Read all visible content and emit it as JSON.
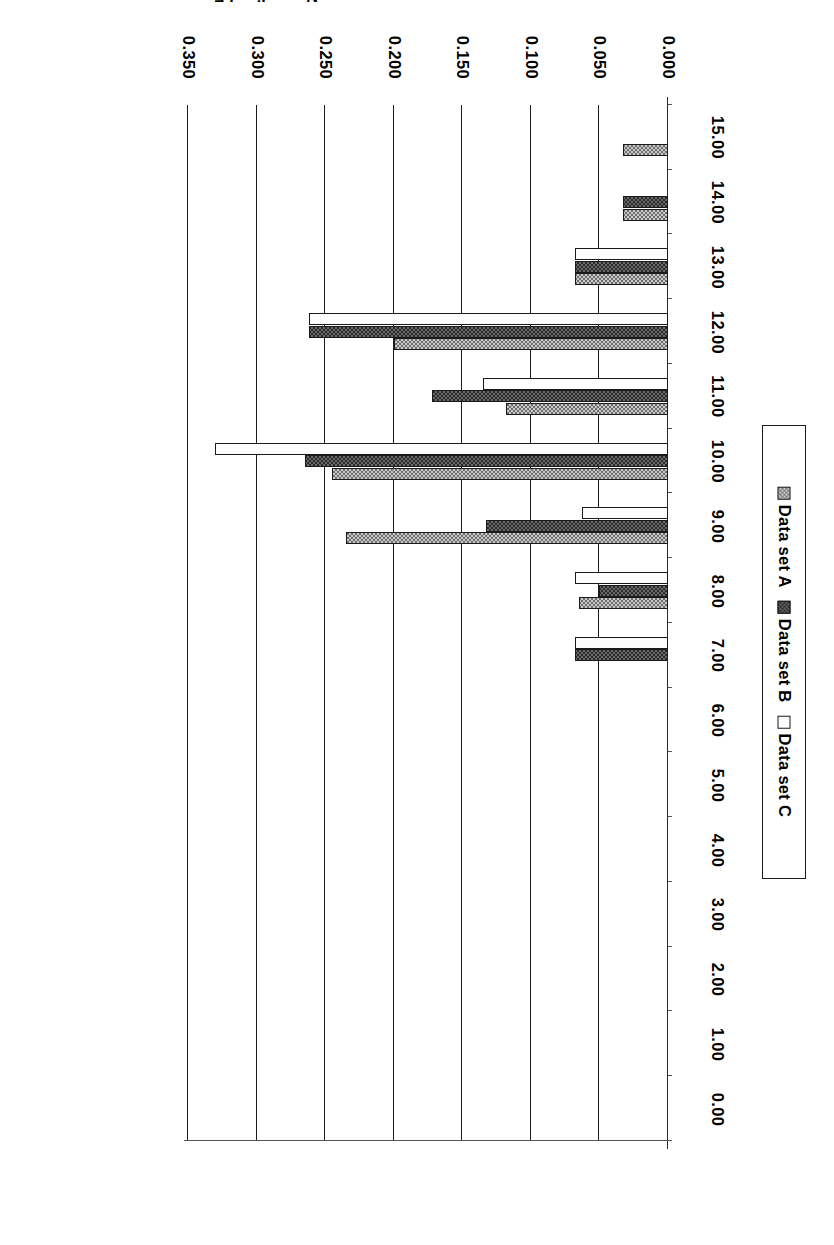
{
  "chart_data": {
    "type": "bar",
    "orientation": "horizontal",
    "title": "",
    "xlabel": "Number of Building Occupants",
    "ylabel": "Normalized Frequency",
    "categories": [
      "0.00",
      "1.00",
      "2.00",
      "3.00",
      "4.00",
      "5.00",
      "6.00",
      "7.00",
      "8.00",
      "9.00",
      "10.00",
      "11.00",
      "12.00",
      "13.00",
      "14.00",
      "15.00"
    ],
    "value_ticks": [
      "0.000",
      "0.050",
      "0.100",
      "0.150",
      "0.200",
      "0.250",
      "0.300",
      "0.350"
    ],
    "value_tick_numbers": [
      0.0,
      0.05,
      0.1,
      0.15,
      0.2,
      0.25,
      0.3,
      0.35
    ],
    "ylim": [
      0.0,
      0.35
    ],
    "grid": true,
    "legend_position": "left",
    "series": [
      {
        "name": "Data set A",
        "fill": "light-checker",
        "values": [
          0.0,
          0.0,
          0.0,
          0.0,
          0.0,
          0.0,
          0.0,
          0.0,
          0.065,
          0.235,
          0.245,
          0.118,
          0.2,
          0.068,
          0.033,
          0.033
        ]
      },
      {
        "name": "Data set B",
        "fill": "dark-checker",
        "values": [
          0.0,
          0.0,
          0.0,
          0.0,
          0.0,
          0.0,
          0.0,
          0.068,
          0.05,
          0.133,
          0.265,
          0.172,
          0.262,
          0.068,
          0.033,
          0.0
        ]
      },
      {
        "name": "Data set C",
        "fill": "white-stipple",
        "values": [
          0.0,
          0.0,
          0.0,
          0.0,
          0.0,
          0.0,
          0.0,
          0.068,
          0.068,
          0.063,
          0.33,
          0.135,
          0.262,
          0.068,
          0.0,
          0.0
        ]
      }
    ]
  },
  "legend": {
    "items": [
      {
        "label": "Data set A",
        "swatch": "light-checker"
      },
      {
        "label": "Data set B",
        "swatch": "dark-checker"
      },
      {
        "label": "Data set C",
        "swatch": "white-stipple"
      }
    ]
  },
  "axes": {
    "value_axis_title": "Normalized Frequency",
    "category_axis_title": "Number of Building Occupants"
  },
  "colors": {
    "axis": "#1b1b1b",
    "grid": "#1b1b1b",
    "series_a": "#c9c9c9",
    "series_b": "#2b2b2b",
    "series_c": "#fdfdfd",
    "background": "#ffffff"
  }
}
